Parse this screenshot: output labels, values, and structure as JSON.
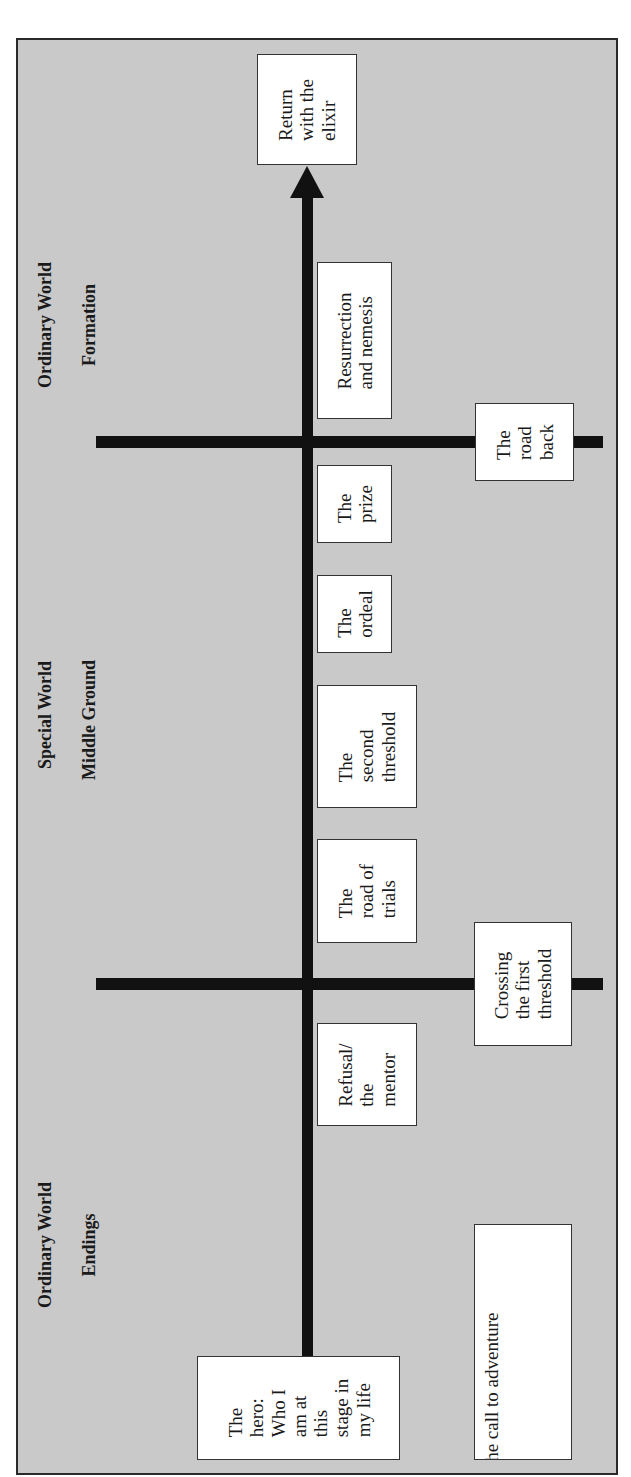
{
  "colors": {
    "background": "#c9c9c9",
    "frame_border": "#2a2a2a",
    "bar": "#111111",
    "box_fill": "#ffffff",
    "text": "#1a1a1a"
  },
  "orientation": "rotated 90 degrees counter-clockwise (reads bottom-to-top)",
  "sections": [
    {
      "world": "Ordinary World",
      "phase": "Endings"
    },
    {
      "world": "Special World",
      "phase": "Middle Ground"
    },
    {
      "world": "Ordinary World",
      "phase": "Formation"
    }
  ],
  "main_axis": {
    "start": "The hero: Who I\nam at\nthis\nstage in\nmy life",
    "end": "Return\nwith the\nelixir"
  },
  "axis_stages": [
    {
      "label": "Refusal/\nthe\nmentor"
    },
    {
      "label": "The\nroad of\ntrials"
    },
    {
      "label": "The\nsecond\nthreshold"
    },
    {
      "label": "The\nordeal"
    },
    {
      "label": "The\nprize"
    },
    {
      "label": "Resurrection\nand nemesis"
    }
  ],
  "boundary_stages": [
    {
      "label": "The call to adventure"
    },
    {
      "label": "Crossing\nthe first\nthreshold"
    },
    {
      "label": "The\nroad\nback"
    }
  ],
  "hero_box": "The\nhero:\nWho I\nam at\nthis\nstage in\nmy life"
}
